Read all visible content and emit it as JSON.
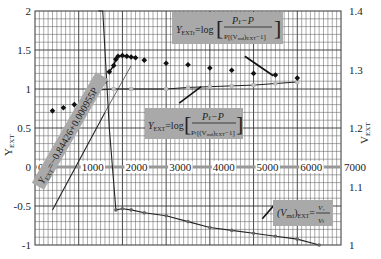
{
  "chart_data": {
    "type": "scatter",
    "title": "",
    "xlabel": "",
    "ylabel_left": "Y_EXT",
    "ylabel_right": "V_EXT",
    "xlim": [
      0,
      7000
    ],
    "ylim_left": [
      -1,
      2
    ],
    "ylim_right": [
      1,
      1.4
    ],
    "x_ticks": [
      "0",
      "1000",
      "2000",
      "3000",
      "4000",
      "5000",
      "6000",
      "7000"
    ],
    "y_left_ticks": [
      "2",
      "1.5",
      "1",
      "0.5",
      "0",
      "-0.5",
      "-1"
    ],
    "y_right_ticks": [
      "1.4",
      "1.3",
      "1.2",
      "1.1",
      "1"
    ],
    "grid": true,
    "series": [
      {
        "name": "Y_EXTr (black diamonds)",
        "x": [
          400,
          650,
          900,
          1200,
          1400,
          1600,
          1700,
          1800,
          1850,
          1900,
          2000,
          2100,
          2200,
          2300,
          2500,
          3000,
          3500,
          4000,
          4500,
          5000,
          5500,
          6000
        ],
        "y": [
          0.72,
          0.76,
          0.8,
          0.9,
          0.94,
          1.1,
          1.22,
          1.3,
          1.38,
          1.42,
          1.43,
          1.42,
          1.41,
          1.4,
          1.37,
          1.33,
          1.31,
          1.27,
          1.24,
          1.2,
          1.18,
          1.14
        ]
      },
      {
        "name": "Y_EXT (gray points, left axis)",
        "x": [
          1800,
          2200,
          3000,
          3500,
          4000,
          4500,
          5000,
          5500,
          6000
        ],
        "y": [
          1.0,
          1.0,
          1.0,
          1.02,
          1.03,
          1.04,
          1.05,
          1.07,
          1.09
        ]
      },
      {
        "name": "Y_EXT = -0.84426 + 0.000955P (fit line)",
        "x": [
          400,
          1600
        ],
        "y": [
          -0.55,
          0.7
        ]
      },
      {
        "name": "(V_md)_EXT = V_1/V_t (right axis)",
        "x": [
          1550,
          1700,
          1850,
          2000,
          2200,
          2500,
          3000,
          3500,
          4000,
          4500,
          5000,
          5500,
          6000,
          6500
        ],
        "y": [
          1.4,
          1.2,
          1.06,
          1.062,
          1.06,
          1.055,
          1.05,
          1.04,
          1.03,
          1.025,
          1.02,
          1.015,
          1.01,
          1.0
        ]
      }
    ],
    "annotations": [
      "Y_EXTr = log[(P_t - P) / P[(V_md)_EXT - 1]]",
      "Y_EXT = log[(P_t - P) / P_t[(V_md)_EXT - 1]]",
      "Y_EXT = -0.84426 + 0.000955P",
      "(V_md)_EXT = V_1 / V_t"
    ]
  },
  "labels": {
    "y_left_axis": "Y",
    "y_left_sub": "EXT",
    "y_right_axis": "V",
    "y_right_sub": "EXT",
    "ann1_main": "Y",
    "ann1_sub": "EXTr",
    "ann1_eq": "=log",
    "ann1_num": "Pₜ−P",
    "ann1_den": "P[(V",
    "ann1_den2": "md",
    "ann1_den3": ")",
    "ann1_den4": "EXT",
    "ann1_den5": "−1]",
    "ann2_main": "Y",
    "ann2_sub": "EXT",
    "ann2_eq": "=log",
    "ann2_num": "Pₜ−P",
    "ann2_den": "Pₜ[(V",
    "ann2_den2": "md",
    "ann2_den3": ")",
    "ann2_den4": "EXT",
    "ann2_den5": "−1]",
    "ann3_text": "Y",
    "ann3_sub": "EXT",
    "ann3_rest": "=−0.84426+0.000955P",
    "ann4_lhs": "(V",
    "ann4_sub1": "md",
    "ann4_lhs2": ")",
    "ann4_sub2": "EXT",
    "ann4_eq": "=",
    "ann4_num": "V₁",
    "ann4_den": "Vₜ"
  }
}
